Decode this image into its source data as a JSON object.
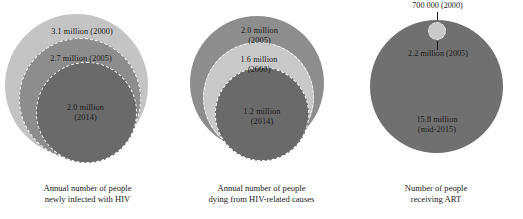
{
  "figure": {
    "background_color": "#ffffff",
    "text_color": "#1b1b1b"
  },
  "chart_data": {
    "type": "bubble",
    "title": "",
    "subtitle": "",
    "xlabel": "",
    "ylabel": "",
    "grid": false,
    "legend_position": "none",
    "note": "Three proportional-area nested bubble charts showing HIV epidemic indicators over time. Bubble area is proportional to the number of people.",
    "panels": [
      {
        "id": "new-infections",
        "caption_line_1": "Annual number of people",
        "caption_line_2": "newly infected with HIV",
        "unit": "people",
        "bubbles": [
          {
            "label": "3.1 million (2000)",
            "label_line_1": "3.1 million (2000)",
            "label_line_2": "",
            "value": 3100000,
            "value_text": "3.1 million",
            "year": "2000",
            "color": "#c4c4c4",
            "rank": "outer"
          },
          {
            "label": "2.7 million (2005)",
            "label_line_1": "2.7 million (2005)",
            "label_line_2": "",
            "value": 2700000,
            "value_text": "2.7 million",
            "year": "2005",
            "color": "#8d8d8d",
            "rank": "middle"
          },
          {
            "label": "2.0 million (2014)",
            "label_line_1": "2.0 million",
            "label_line_2": "(2014)",
            "value": 2000000,
            "value_text": "2.0 million",
            "year": "2014",
            "color": "#6a6a6a",
            "rank": "inner"
          }
        ]
      },
      {
        "id": "hiv-related-deaths",
        "caption_line_1": "Annual number of people",
        "caption_line_2": "dying from HIV-related causes",
        "unit": "people",
        "bubbles": [
          {
            "label": "2.0 million (2005)",
            "label_line_1": "2.0 million",
            "label_line_2": "(2005)",
            "value": 2000000,
            "value_text": "2.0 million",
            "year": "2005",
            "color": "#8d8d8d",
            "rank": "outer"
          },
          {
            "label": "1.6 million (2000)",
            "label_line_1": "1.6 million",
            "label_line_2": "(2000)",
            "value": 1600000,
            "value_text": "1.6 million",
            "year": "2000",
            "color": "#c9c9c9",
            "rank": "middle"
          },
          {
            "label": "1.2 million (2014)",
            "label_line_1": "1.2 million",
            "label_line_2": "(2014)",
            "value": 1200000,
            "value_text": "1.2 million",
            "year": "2014",
            "color": "#6a6a6a",
            "rank": "inner"
          }
        ]
      },
      {
        "id": "receiving-art",
        "caption_line_1": "Number of people",
        "caption_line_2": "receiving ART",
        "unit": "people",
        "bubbles": [
          {
            "label": "15.8 million (mid-2015)",
            "label_line_1": "15.8 million",
            "label_line_2": "(mid-2015)",
            "value": 15800000,
            "value_text": "15.8 million",
            "year": "mid-2015",
            "color": "#707070",
            "rank": "outer"
          },
          {
            "label": "2.2 million (2005)",
            "label_line_1": "2.2 million (2005)",
            "label_line_2": "",
            "value": 2200000,
            "value_text": "2.2 million",
            "year": "2005",
            "color": "#707070",
            "rank": "callout-middle"
          },
          {
            "label": "700 000 (2000)",
            "label_line_1": "700 000 (2000)",
            "label_line_2": "",
            "value": 700000,
            "value_text": "700 000",
            "year": "2000",
            "color": "#c9c9c9",
            "rank": "callout-inner"
          }
        ]
      }
    ]
  }
}
